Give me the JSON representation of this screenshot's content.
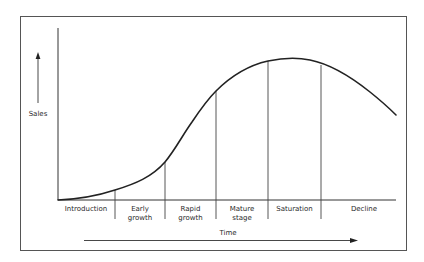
{
  "diagram": {
    "type": "product-life-cycle",
    "y_axis_label": "Sales",
    "x_axis_label": "Time",
    "stages": [
      {
        "id": "introduction",
        "lines": [
          "Introduction"
        ]
      },
      {
        "id": "early-growth",
        "lines": [
          "Early",
          "growth"
        ]
      },
      {
        "id": "rapid-growth",
        "lines": [
          "Rapid",
          "growth"
        ]
      },
      {
        "id": "mature-stage",
        "lines": [
          "Mature",
          "stage"
        ]
      },
      {
        "id": "saturation",
        "lines": [
          "Saturation"
        ]
      },
      {
        "id": "decline",
        "lines": [
          "Decline"
        ]
      }
    ],
    "colors": {
      "line": "#222222",
      "frame": "#555555",
      "divider": "#444444",
      "background": "#ffffff"
    }
  }
}
